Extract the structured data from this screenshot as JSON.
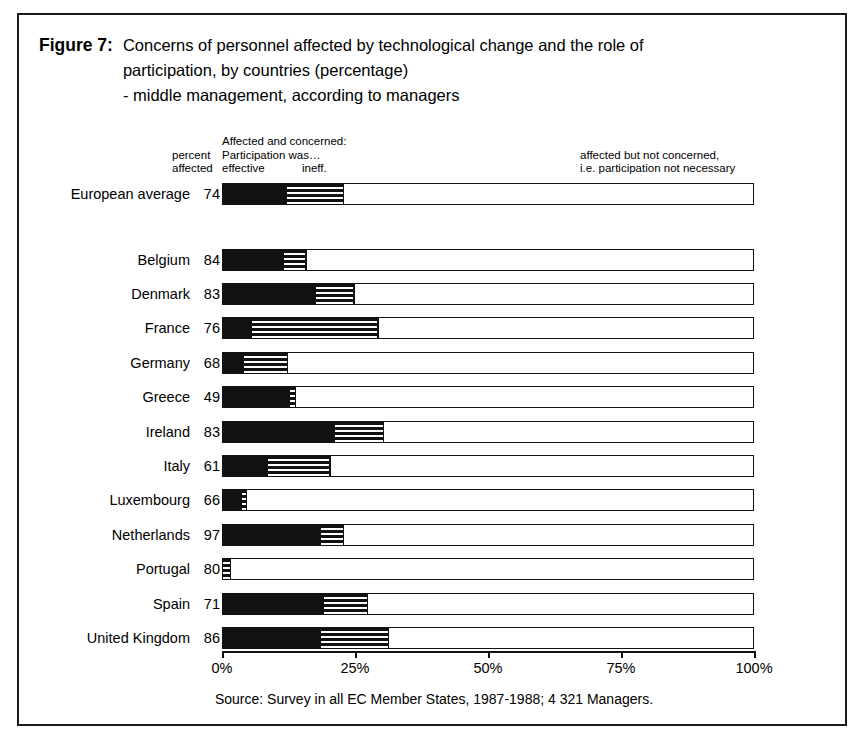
{
  "figure": {
    "label": "Figure 7:",
    "title_lines": [
      "Concerns of personnel affected by technological change and the role of",
      "participation, by countries (percentage)",
      "- middle management, according to managers"
    ],
    "source": "Source: Survey in all EC Member States, 1987-1988; 4 321 Managers."
  },
  "legend": {
    "percent_affected_line1": "percent",
    "percent_affected_line2": "affected",
    "affected_and_concerned": "Affected and concerned:",
    "participation_was": "Participation was…",
    "effective": "effective",
    "ineffective": "ineff.",
    "not_concerned_line1": "affected but not concerned,",
    "not_concerned_line2": "i.e. participation not necessary"
  },
  "chart_data": {
    "type": "bar",
    "orientation": "horizontal",
    "stacked": true,
    "title": "Concerns of personnel affected by technological change and the role of participation, by countries (percentage) - middle management, according to managers",
    "xlabel": "",
    "ylabel": "",
    "xlim": [
      0,
      100
    ],
    "xticks": [
      0,
      25,
      50,
      75,
      100
    ],
    "xtick_labels": [
      "0%",
      "25%",
      "50%",
      "75%",
      "100%"
    ],
    "grid": false,
    "legend_position": "top",
    "series": [
      {
        "name": "Affected and concerned: Participation was effective",
        "key": "effective",
        "color": "#111111",
        "pattern": "solid",
        "values": [
          12.0,
          11.5,
          17.5,
          5.5,
          4.0,
          12.5,
          21.0,
          8.5,
          3.5,
          18.5,
          0.0,
          19.0,
          18.5
        ]
      },
      {
        "name": "Affected and concerned: Participation was ineffective",
        "key": "ineffective",
        "color": "#111111",
        "pattern": "horizontal-stripes",
        "values": [
          10.5,
          4.0,
          7.0,
          23.5,
          8.0,
          1.0,
          9.0,
          11.5,
          0.8,
          4.0,
          1.3,
          8.0,
          12.5
        ]
      },
      {
        "name": "affected but not concerned, i.e. participation not necessary",
        "key": "not_concerned",
        "color": "#ffffff",
        "pattern": "empty",
        "values": [
          77.5,
          84.5,
          75.5,
          71.0,
          88.0,
          86.5,
          70.0,
          80.0,
          95.7,
          77.5,
          98.7,
          73.0,
          69.0
        ]
      }
    ],
    "categories": [
      "European average",
      "Belgium",
      "Denmark",
      "France",
      "Germany",
      "Greece",
      "Ireland",
      "Italy",
      "Luxembourg",
      "Netherlands",
      "Portugal",
      "Spain",
      "United Kingdom"
    ],
    "percent_affected": [
      74,
      84,
      83,
      76,
      68,
      49,
      83,
      61,
      66,
      97,
      80,
      71,
      86
    ]
  },
  "rows": [
    {
      "label": "European average",
      "percent_affected": "74",
      "effective": 12.0,
      "ineffective": 10.5,
      "top": 168,
      "gap_after": true
    },
    {
      "label": "Belgium",
      "percent_affected": "84",
      "effective": 11.5,
      "ineffective": 4.0,
      "top": 234
    },
    {
      "label": "Denmark",
      "percent_affected": "83",
      "effective": 17.5,
      "ineffective": 7.0,
      "top": 268
    },
    {
      "label": "France",
      "percent_affected": "76",
      "effective": 5.5,
      "ineffective": 23.5,
      "top": 302
    },
    {
      "label": "Germany",
      "percent_affected": "68",
      "effective": 4.0,
      "ineffective": 8.0,
      "top": 337
    },
    {
      "label": "Greece",
      "percent_affected": "49",
      "effective": 12.5,
      "ineffective": 1.0,
      "top": 371
    },
    {
      "label": "Ireland",
      "percent_affected": "83",
      "effective": 21.0,
      "ineffective": 9.0,
      "top": 406
    },
    {
      "label": "Italy",
      "percent_affected": "61",
      "effective": 8.5,
      "ineffective": 11.5,
      "top": 440
    },
    {
      "label": "Luxembourg",
      "percent_affected": "66",
      "effective": 3.5,
      "ineffective": 0.8,
      "top": 474
    },
    {
      "label": "Netherlands",
      "percent_affected": "97",
      "effective": 18.5,
      "ineffective": 4.0,
      "top": 509
    },
    {
      "label": "Portugal",
      "percent_affected": "80",
      "effective": 0.0,
      "ineffective": 1.3,
      "top": 543
    },
    {
      "label": "Spain",
      "percent_affected": "71",
      "effective": 19.0,
      "ineffective": 8.0,
      "top": 578
    },
    {
      "label": "United Kingdom",
      "percent_affected": "86",
      "effective": 18.5,
      "ineffective": 12.5,
      "top": 612
    }
  ],
  "axis": {
    "ticks": [
      {
        "label": "0%",
        "pct": 0
      },
      {
        "label": "25%",
        "pct": 25
      },
      {
        "label": "50%",
        "pct": 50
      },
      {
        "label": "75%",
        "pct": 75
      },
      {
        "label": "100%",
        "pct": 100
      }
    ]
  }
}
